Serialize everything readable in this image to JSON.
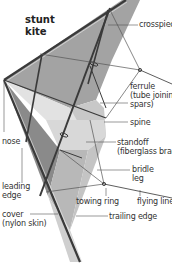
{
  "title": {
    "line1": "stunt",
    "line2": "kite"
  },
  "labels": {
    "crosspiece": "crosspiece",
    "ferrule_l1": "ferrule",
    "ferrule_l2": "(tube joining",
    "ferrule_l3": "spars)",
    "spine": "spine",
    "standoff_l1": "standoff",
    "standoff_l2": "(fiberglass brace)",
    "bridle_l1": "bridle",
    "bridle_l2": "leg",
    "nose": "nose",
    "leading_l1": "leading",
    "leading_l2": "edge",
    "cover_l1": "cover",
    "cover_l2": "(nylon skin)",
    "towing_ring": "towing ring",
    "flying_line": "flying line",
    "trailing_edge": "trailing edge"
  },
  "colors": {
    "sail_dark": "#8c8c8c",
    "sail_mid": "#b4b4b4",
    "sail_light": "#d4d4d4",
    "sail_lighter": "#e6e6e6",
    "spar": "#3a3a3a",
    "leader": "#555555"
  }
}
